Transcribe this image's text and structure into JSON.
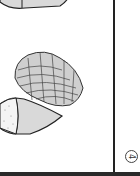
{
  "page": {
    "page_number": "4",
    "illustrations": [
      {
        "name": "seed-top",
        "description": "partial seed/pod shape at top-left"
      },
      {
        "name": "cone",
        "description": "scaly cone drawing"
      },
      {
        "name": "seed-bottom",
        "description": "pointed seed with stippled cap"
      }
    ],
    "colors": {
      "ink": "#222222",
      "fill": "#d9d9d9",
      "paper": "#ffffff"
    }
  }
}
